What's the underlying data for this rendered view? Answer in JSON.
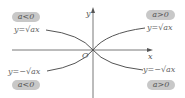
{
  "diagram": {
    "axes": {
      "x_label": "x",
      "y_label": "y",
      "origin_label": "O"
    },
    "badges": {
      "top_left": "a<0",
      "top_right": "a>0",
      "bottom_left": "a<0",
      "bottom_right": "a>0"
    },
    "curve_labels": {
      "top_left": "y=√ax",
      "top_right": "y=√ax",
      "bottom_left": "y=−√ax",
      "bottom_right": "y=−√ax"
    },
    "colors": {
      "curve": "#555555",
      "axis": "#555555",
      "badge_fill": "#c8c8c8",
      "text": "#666666"
    }
  }
}
